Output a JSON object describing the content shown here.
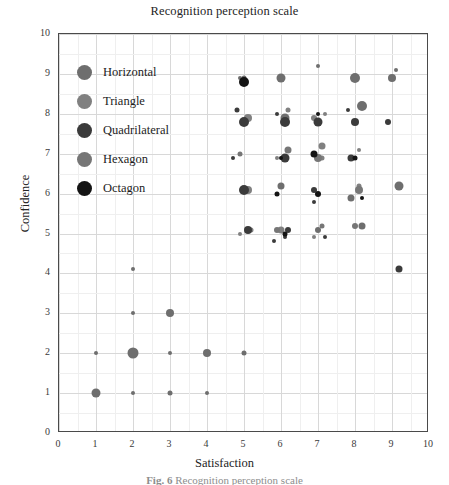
{
  "chart_data": {
    "type": "scatter",
    "title": "Recognition perception scale",
    "xlabel": "Satisfaction",
    "ylabel": "Confidence",
    "xlim": [
      0,
      10
    ],
    "ylim": [
      0,
      10
    ],
    "xticks": [
      "0",
      "1",
      "2",
      "3",
      "4",
      "5",
      "6",
      "7",
      "8",
      "9",
      "10"
    ],
    "yticks": [
      "0",
      "1",
      "2",
      "3",
      "4",
      "5",
      "6",
      "7",
      "8",
      "9",
      "10"
    ],
    "grid": true,
    "legend_position": "upper-left-inside",
    "series": [
      {
        "name": "Horizontal",
        "color": "#6e6e6e",
        "points": [
          {
            "x": 1.0,
            "y": 1.0,
            "size": 9
          },
          {
            "x": 2.0,
            "y": 2.0,
            "size": 11
          },
          {
            "x": 3.0,
            "y": 3.0,
            "size": 8
          },
          {
            "x": 4.0,
            "y": 2.0,
            "size": 8
          },
          {
            "x": 5.0,
            "y": 8.9,
            "size": 5
          },
          {
            "x": 6.0,
            "y": 8.9,
            "size": 9
          },
          {
            "x": 8.0,
            "y": 8.9,
            "size": 10
          },
          {
            "x": 9.0,
            "y": 8.9,
            "size": 8
          },
          {
            "x": 6.1,
            "y": 7.9,
            "size": 9
          },
          {
            "x": 8.2,
            "y": 8.2,
            "size": 10
          },
          {
            "x": 9.2,
            "y": 6.2,
            "size": 9
          },
          {
            "x": 6.0,
            "y": 6.2,
            "size": 7
          },
          {
            "x": 7.9,
            "y": 5.9,
            "size": 7
          },
          {
            "x": 8.2,
            "y": 5.2,
            "size": 7
          },
          {
            "x": 7.0,
            "y": 5.1,
            "size": 6
          },
          {
            "x": 3.0,
            "y": 1.0,
            "size": 5
          },
          {
            "x": 2.0,
            "y": 4.1,
            "size": 4
          },
          {
            "x": 1.0,
            "y": 2.0,
            "size": 4
          },
          {
            "x": 4.0,
            "y": 1.0,
            "size": 4
          },
          {
            "x": 2.0,
            "y": 3.0,
            "size": 4
          },
          {
            "x": 5.0,
            "y": 2.0,
            "size": 5
          },
          {
            "x": 2.0,
            "y": 1.0,
            "size": 4
          },
          {
            "x": 3.0,
            "y": 2.0,
            "size": 4
          },
          {
            "x": 7.0,
            "y": 9.2,
            "size": 4
          },
          {
            "x": 9.1,
            "y": 9.1,
            "size": 4
          },
          {
            "x": 4.9,
            "y": 8.9,
            "size": 4
          }
        ]
      },
      {
        "name": "Triangle",
        "color": "#808080",
        "points": [
          {
            "x": 5.1,
            "y": 7.9,
            "size": 8
          },
          {
            "x": 6.9,
            "y": 7.9,
            "size": 6
          },
          {
            "x": 7.1,
            "y": 7.2,
            "size": 7
          },
          {
            "x": 5.1,
            "y": 6.1,
            "size": 8
          },
          {
            "x": 6.0,
            "y": 5.1,
            "size": 7
          },
          {
            "x": 7.1,
            "y": 6.9,
            "size": 5
          },
          {
            "x": 8.1,
            "y": 6.2,
            "size": 5
          },
          {
            "x": 5.2,
            "y": 5.1,
            "size": 5
          },
          {
            "x": 6.2,
            "y": 8.1,
            "size": 5
          },
          {
            "x": 7.2,
            "y": 8.0,
            "size": 4
          },
          {
            "x": 8.1,
            "y": 7.1,
            "size": 4
          },
          {
            "x": 6.9,
            "y": 4.9,
            "size": 4
          },
          {
            "x": 5.9,
            "y": 6.9,
            "size": 4
          },
          {
            "x": 4.9,
            "y": 5.0,
            "size": 4
          }
        ]
      },
      {
        "name": "Quadrilateral",
        "color": "#3b3b3b",
        "points": [
          {
            "x": 5.0,
            "y": 7.8,
            "size": 10
          },
          {
            "x": 6.1,
            "y": 7.8,
            "size": 10
          },
          {
            "x": 5.0,
            "y": 6.1,
            "size": 10
          },
          {
            "x": 6.1,
            "y": 6.9,
            "size": 9
          },
          {
            "x": 7.0,
            "y": 7.8,
            "size": 9
          },
          {
            "x": 8.0,
            "y": 7.8,
            "size": 8
          },
          {
            "x": 5.1,
            "y": 5.1,
            "size": 8
          },
          {
            "x": 7.9,
            "y": 6.9,
            "size": 7
          },
          {
            "x": 6.9,
            "y": 6.1,
            "size": 6
          },
          {
            "x": 8.9,
            "y": 7.8,
            "size": 6
          },
          {
            "x": 9.2,
            "y": 4.1,
            "size": 7
          },
          {
            "x": 6.2,
            "y": 5.1,
            "size": 6
          },
          {
            "x": 4.8,
            "y": 8.1,
            "size": 5
          },
          {
            "x": 5.9,
            "y": 8.0,
            "size": 4
          },
          {
            "x": 7.8,
            "y": 8.1,
            "size": 4
          },
          {
            "x": 6.1,
            "y": 4.9,
            "size": 4
          },
          {
            "x": 6.9,
            "y": 5.8,
            "size": 4
          },
          {
            "x": 7.2,
            "y": 4.9,
            "size": 4
          },
          {
            "x": 4.7,
            "y": 6.9,
            "size": 4
          },
          {
            "x": 5.8,
            "y": 4.8,
            "size": 4
          }
        ]
      },
      {
        "name": "Hexagon",
        "color": "#767676",
        "points": [
          {
            "x": 7.0,
            "y": 6.9,
            "size": 8
          },
          {
            "x": 8.1,
            "y": 6.1,
            "size": 8
          },
          {
            "x": 6.2,
            "y": 7.1,
            "size": 7
          },
          {
            "x": 5.9,
            "y": 5.1,
            "size": 6
          },
          {
            "x": 7.1,
            "y": 5.2,
            "size": 5
          },
          {
            "x": 8.0,
            "y": 5.2,
            "size": 6
          },
          {
            "x": 4.9,
            "y": 7.0,
            "size": 5
          }
        ]
      },
      {
        "name": "Octagon",
        "color": "#141414",
        "points": [
          {
            "x": 5.0,
            "y": 8.8,
            "size": 10
          },
          {
            "x": 6.9,
            "y": 7.0,
            "size": 7
          },
          {
            "x": 7.0,
            "y": 6.0,
            "size": 6
          },
          {
            "x": 6.1,
            "y": 5.0,
            "size": 5
          },
          {
            "x": 5.9,
            "y": 6.0,
            "size": 5
          },
          {
            "x": 8.0,
            "y": 6.9,
            "size": 5
          },
          {
            "x": 6.0,
            "y": 6.9,
            "size": 4
          },
          {
            "x": 7.0,
            "y": 8.0,
            "size": 4
          },
          {
            "x": 8.2,
            "y": 5.9,
            "size": 4
          }
        ]
      }
    ]
  },
  "legend": {
    "items": [
      {
        "label": "Horizontal",
        "color": "#6e6e6e"
      },
      {
        "label": "Triangle",
        "color": "#808080"
      },
      {
        "label": "Quadrilateral",
        "color": "#3b3b3b"
      },
      {
        "label": "Hexagon",
        "color": "#767676"
      },
      {
        "label": "Octagon",
        "color": "#141414"
      }
    ]
  },
  "caption": {
    "prefix": "Fig. 6",
    "text": "Recognition perception scale"
  }
}
